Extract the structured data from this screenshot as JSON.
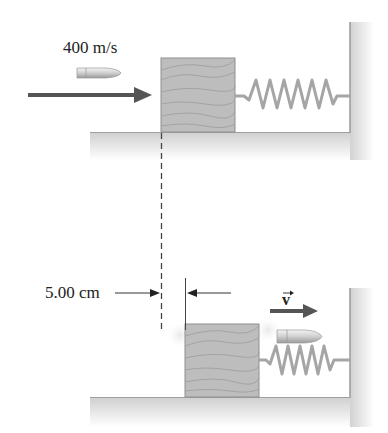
{
  "figure": {
    "top_panel": {
      "bullet_speed_label": "400 m/s",
      "description": "Bullet approaching wooden block attached to spring and wall"
    },
    "bottom_panel": {
      "displacement_label": "5.00 cm",
      "velocity_label": "v",
      "description": "Bullet passes through block; block displaced, bullet exits with velocity v"
    },
    "colors": {
      "arrow": "#555555",
      "block": "#b9b9b9",
      "wood_grain": "#9a9a9a",
      "spring": "#a8a8a8",
      "floor": "#d6d6d6",
      "bullet": "#d9d9d9"
    }
  }
}
